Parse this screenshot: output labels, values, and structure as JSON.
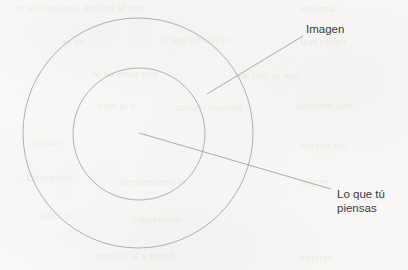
{
  "diagram": {
    "type": "concentric-circles",
    "title": "",
    "background_color": "#f8f7f5",
    "stroke_color": "#9a9a9a",
    "text_color": "#3b3b3b",
    "shapes": [
      {
        "name": "outer-circle",
        "cx": 138,
        "cy": 133,
        "r": 115
      },
      {
        "name": "inner-circle",
        "cx": 139,
        "cy": 134,
        "r": 66
      }
    ],
    "leader_lines": [
      {
        "name": "imagen-leader",
        "x1": 303,
        "y1": 36,
        "x2": 207,
        "y2": 94
      },
      {
        "name": "pensamiento-leader",
        "x1": 139,
        "y1": 133,
        "x2": 331,
        "y2": 189
      }
    ],
    "labels": {
      "imagen": "Imagen",
      "pensamiento_line1": "Lo que tú",
      "pensamiento_line2": "piensas"
    },
    "bleed_through": [
      {
        "text": "que la imagen concentrada en",
        "x": 14,
        "y": 2,
        "size": 10
      },
      {
        "text": "la mente",
        "x": 300,
        "y": 3,
        "size": 10
      },
      {
        "text": "no es",
        "x": 62,
        "y": 36,
        "size": 10
      },
      {
        "text": "lo mismo que la",
        "x": 160,
        "y": 34,
        "size": 10
      },
      {
        "text": "figura real",
        "x": 300,
        "y": 36,
        "size": 10
      },
      {
        "text": "una parte de lo",
        "x": 92,
        "y": 68,
        "size": 10
      },
      {
        "text": "que se percibe",
        "x": 236,
        "y": 70,
        "size": 10
      },
      {
        "text": "y la idea",
        "x": 98,
        "y": 100,
        "size": 10
      },
      {
        "text": "siempre resulta",
        "x": 176,
        "y": 102,
        "size": 10
      },
      {
        "text": "más pequeña",
        "x": 296,
        "y": 100,
        "size": 10
      },
      {
        "text": "interior",
        "x": 30,
        "y": 136,
        "size": 10
      },
      {
        "text": "del círculo",
        "x": 300,
        "y": 140,
        "size": 10
      },
      {
        "text": "representa",
        "x": 26,
        "y": 172,
        "size": 10
      },
      {
        "text": "el pensamiento",
        "x": 120,
        "y": 176,
        "size": 10
      },
      {
        "text": "propio",
        "x": 300,
        "y": 176,
        "size": 10
      },
      {
        "text": "de cada",
        "x": 40,
        "y": 210,
        "size": 10
      },
      {
        "text": "observador",
        "x": 132,
        "y": 214,
        "size": 10
      },
      {
        "text": "frente a la imagen",
        "x": 96,
        "y": 250,
        "size": 10
      },
      {
        "text": "externa",
        "x": 300,
        "y": 252,
        "size": 10
      }
    ]
  }
}
